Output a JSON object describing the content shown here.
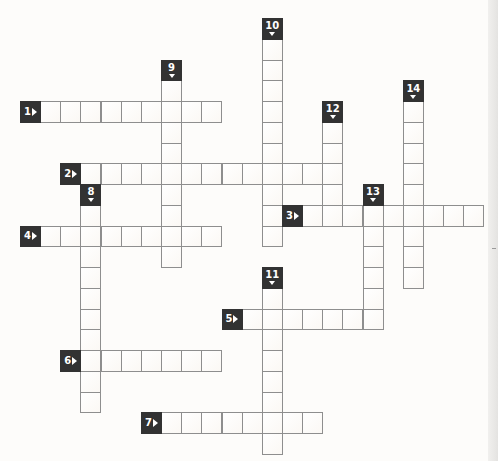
{
  "puzzle": {
    "type": "crossword",
    "grid": {
      "origin_x": 20,
      "origin_y": 18,
      "cell_width": 20.15,
      "cell_height": 20.75,
      "columns": 23,
      "rows": 21
    },
    "clues": {
      "across": [
        {
          "number": "1",
          "label_col": 0,
          "label_row": 4,
          "length": 9
        },
        {
          "number": "2",
          "label_col": 2,
          "label_row": 7,
          "length": 13
        },
        {
          "number": "3",
          "label_col": 13,
          "label_row": 9,
          "length": 9
        },
        {
          "number": "4",
          "label_col": 0,
          "label_row": 10,
          "length": 9
        },
        {
          "number": "5",
          "label_col": 10,
          "label_row": 14,
          "length": 7
        },
        {
          "number": "6",
          "label_col": 2,
          "label_row": 16,
          "length": 7
        },
        {
          "number": "7",
          "label_col": 6,
          "label_row": 19,
          "length": 8
        }
      ],
      "down": [
        {
          "number": "8",
          "label_col": 3,
          "label_row": 8,
          "length": 10
        },
        {
          "number": "9",
          "label_col": 7,
          "label_row": 2,
          "length": 9
        },
        {
          "number": "10",
          "label_col": 12,
          "label_row": 0,
          "length": 10
        },
        {
          "number": "11",
          "label_col": 12,
          "label_row": 12,
          "length": 8
        },
        {
          "number": "12",
          "label_col": 15,
          "label_row": 4,
          "length": 4
        },
        {
          "number": "13",
          "label_col": 17,
          "label_row": 8,
          "length": 6
        },
        {
          "number": "14",
          "label_col": 19,
          "label_row": 3,
          "length": 9
        }
      ]
    },
    "icons": {
      "across_marker": "triangle-right-icon",
      "down_marker": "triangle-down-icon"
    },
    "colors": {
      "label_background": "#323232",
      "label_text": "#ffffff",
      "cell_border": "#8e8e8e",
      "cell_fill": "#fdfbf8",
      "page_background": "#fdfcfa"
    }
  }
}
